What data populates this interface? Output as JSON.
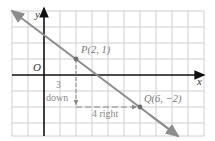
{
  "diagram": {
    "type": "coordinate-plane-line",
    "axes": {
      "x_label": "x",
      "y_label": "y",
      "origin_label": "O"
    },
    "points": [
      {
        "name": "P",
        "label": "P(2, 1)",
        "x": 2,
        "y": 1
      },
      {
        "name": "Q",
        "label": "Q(6, −2)",
        "x": 6,
        "y": -2
      }
    ],
    "rise_annotation": {
      "number": "3",
      "word": "down"
    },
    "run_annotation": "4 right",
    "line": {
      "slope": "-3/4",
      "color": "#8c8c8c"
    },
    "colors": {
      "grid": "#cfcfcf",
      "axis": "#111111",
      "line": "#8c8c8c",
      "point": "#6e6e6e",
      "text": "#777777",
      "annot": "#8a8a8a"
    }
  }
}
